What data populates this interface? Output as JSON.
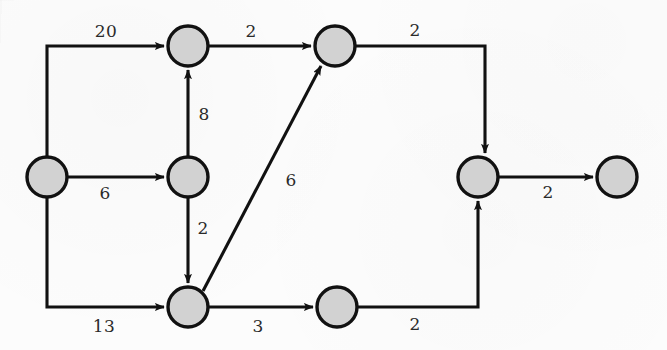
{
  "diagram": {
    "background_color": "#fcfcfc",
    "node_fill": "#d2d2d2",
    "node_stroke": "#111111",
    "edge_color": "#111111",
    "label_color": "#2a2a2a",
    "node_radius": 20,
    "nodes": [
      {
        "id": "n-left",
        "name": "node-left",
        "cx": 47,
        "cy": 177
      },
      {
        "id": "n-top-left",
        "name": "node-top-left",
        "cx": 188,
        "cy": 46
      },
      {
        "id": "n-middle",
        "name": "node-middle",
        "cx": 188,
        "cy": 177
      },
      {
        "id": "n-bottom-left",
        "name": "node-bottom-left",
        "cx": 188,
        "cy": 307
      },
      {
        "id": "n-top-right",
        "name": "node-top-right",
        "cx": 335,
        "cy": 46
      },
      {
        "id": "n-bottom-mid",
        "name": "node-bottom-middle",
        "cx": 337,
        "cy": 307
      },
      {
        "id": "n-right",
        "name": "node-right",
        "cx": 478,
        "cy": 177
      },
      {
        "id": "n-far-right",
        "name": "node-far-right",
        "cx": 617,
        "cy": 177
      }
    ],
    "edges": [
      {
        "id": "e-20",
        "name": "edge-left-to-top-left",
        "from": "n-left",
        "to": "n-top-left",
        "weight": "20",
        "label_x": 106,
        "label_y": 31
      },
      {
        "id": "e-2a",
        "name": "edge-top-left-to-top-right",
        "from": "n-top-left",
        "to": "n-top-right",
        "weight": "2",
        "label_x": 251,
        "label_y": 31
      },
      {
        "id": "e-2b",
        "name": "edge-top-right-to-right",
        "from": "n-top-right",
        "to": "n-right",
        "weight": "2",
        "label_x": 415,
        "label_y": 30
      },
      {
        "id": "e-8",
        "name": "edge-middle-to-top-left",
        "from": "n-middle",
        "to": "n-top-left",
        "weight": "8",
        "label_x": 204,
        "label_y": 114
      },
      {
        "id": "e-6a",
        "name": "edge-left-to-middle",
        "from": "n-left",
        "to": "n-middle",
        "weight": "6",
        "label_x": 105,
        "label_y": 193
      },
      {
        "id": "e-2c",
        "name": "edge-middle-to-bottom-left",
        "from": "n-middle",
        "to": "n-bottom-left",
        "weight": "2",
        "label_x": 203,
        "label_y": 228
      },
      {
        "id": "e-6b",
        "name": "edge-bottom-left-to-top-right",
        "from": "n-bottom-left",
        "to": "n-top-right",
        "weight": "6",
        "label_x": 291,
        "label_y": 180
      },
      {
        "id": "e-13",
        "name": "edge-left-to-bottom-left",
        "from": "n-left",
        "to": "n-bottom-left",
        "weight": "13",
        "label_x": 104,
        "label_y": 326
      },
      {
        "id": "e-3",
        "name": "edge-bottom-left-to-bottom-mid",
        "from": "n-bottom-left",
        "to": "n-bottom-mid",
        "weight": "3",
        "label_x": 258,
        "label_y": 326
      },
      {
        "id": "e-2d",
        "name": "edge-bottom-mid-to-right",
        "from": "n-bottom-mid",
        "to": "n-right",
        "weight": "2",
        "label_x": 415,
        "label_y": 324
      },
      {
        "id": "e-2e",
        "name": "edge-right-to-far-right",
        "from": "n-right",
        "to": "n-far-right",
        "weight": "2",
        "label_x": 548,
        "label_y": 192
      }
    ]
  }
}
